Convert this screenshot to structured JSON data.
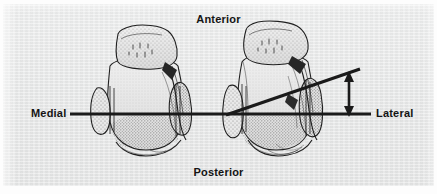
{
  "figure": {
    "background_color": "#e7e8e8",
    "ink_color": "#1d1d1d",
    "orientation_labels": {
      "anterior": "Anterior",
      "posterior": "Posterior",
      "medial": "Medial",
      "lateral": "Lateral"
    },
    "elements": {
      "reference_axis_name": "horizontal-reference-line",
      "tilted_axis_name": "tilted-joint-line",
      "measure_arrow_name": "vertical-double-arrow"
    }
  }
}
